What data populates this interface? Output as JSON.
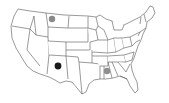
{
  "map": {
    "region": "Contiguous United States",
    "outline_color": "#555555",
    "fill_color": "#ffffff",
    "markers": [
      {
        "state": "Montana",
        "x": 52,
        "y": 19,
        "r": 3.2,
        "color": "#8a8a8a"
      },
      {
        "state": "New Mexico",
        "x": 58,
        "y": 66,
        "r": 3.4,
        "color": "#1a1a1a"
      },
      {
        "state": "Mississippi/Alabama",
        "x": 107,
        "y": 71,
        "r": 3.2,
        "color": "#8f8f8f"
      }
    ]
  }
}
